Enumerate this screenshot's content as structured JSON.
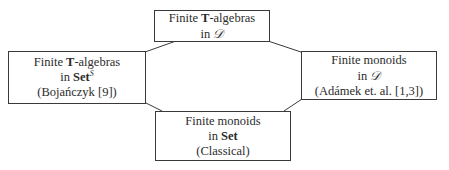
{
  "diagram": {
    "nodes": {
      "top": {
        "line1_prefix": "Finite ",
        "line1_bold": "T",
        "line1_suffix": "-algebras",
        "line2_prefix": "in ",
        "line2_symbol": "𝒟"
      },
      "left": {
        "line1_prefix": "Finite ",
        "line1_bold": "T",
        "line1_suffix": "-algebras",
        "line2_prefix": "in ",
        "line2_bold": "Set",
        "line2_sup": "S",
        "line3": "(Bojańczyk [9])"
      },
      "right": {
        "line1": "Finite monoids",
        "line2_prefix": "in ",
        "line2_symbol": "𝒟",
        "line3": "(Adámek et. al. [1,3])"
      },
      "bottom": {
        "line1": "Finite monoids",
        "line2_prefix": "in ",
        "line2_bold": "Set",
        "line3": "(Classical)"
      }
    },
    "edges": [
      {
        "from": "top",
        "to": "left"
      },
      {
        "from": "top",
        "to": "right"
      },
      {
        "from": "left",
        "to": "bottom"
      },
      {
        "from": "right",
        "to": "bottom"
      }
    ],
    "colors": {
      "stroke": "#3a3a3a",
      "background": "#ffffff",
      "text": "#2b2b2b"
    }
  }
}
